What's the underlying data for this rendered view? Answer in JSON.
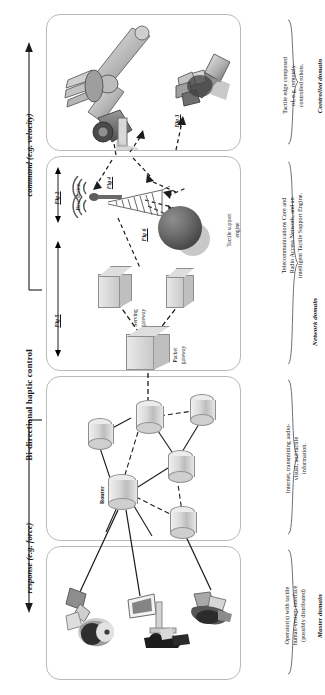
{
  "figure": {
    "orientation": "rotated-90-ccw"
  },
  "axis": {
    "main_label": "Bi-directional haptic control",
    "command_label": "command (e.g. velocity)",
    "response_label": "response (e.g. force)"
  },
  "fig_refs": {
    "fig2": "Fig 2",
    "fig3": "Fig 3",
    "fig4": "Fig 4",
    "fig5": "Fig 5",
    "fig6": "Fig 6"
  },
  "domains": [
    {
      "id": "controlled",
      "name": "Controlled domain",
      "description": "Tactile edge composed of, e.g. remotely controlled robots.",
      "nodes": [
        {
          "name": "robot-arm",
          "label": ""
        },
        {
          "name": "robot-gripper-hand",
          "label": ""
        }
      ]
    },
    {
      "id": "network",
      "name": "Network domain",
      "description": "Telecommunications Core and Radio Access Network, and an intelligent Tactile Support Engine.",
      "nodes": [
        {
          "name": "base-station",
          "label": "Base station"
        },
        {
          "name": "tactile-support-engine",
          "label": "Tactile support engine"
        },
        {
          "name": "serving-gateway",
          "label": "Serving gateway"
        },
        {
          "name": "packet-gateway",
          "label": "Packet gateway"
        }
      ]
    },
    {
      "id": "internet",
      "name": "",
      "description": "Internet, transmitting audio-visual, and tactile information.",
      "nodes": [
        {
          "name": "router",
          "label": "Router"
        }
      ]
    },
    {
      "id": "master",
      "name": "Master domain",
      "description": "Operator(s) with tactile human-system interface (possibly distributed)",
      "nodes": [
        {
          "name": "operator-one",
          "label": ""
        },
        {
          "name": "operator-two",
          "label": ""
        },
        {
          "name": "operator-three",
          "label": ""
        }
      ]
    }
  ],
  "labels": {
    "base_station": "Base station",
    "tactile_support_engine_l1": "Tactile support",
    "tactile_support_engine_l2": "engine",
    "serving_gateway_l1": "Serving",
    "serving_gateway_l2": "gateway",
    "packet_gateway_l1": "Packet",
    "packet_gateway_l2": "gateway",
    "router": "Router"
  },
  "descriptions": {
    "controlled_l1": "Tactile edge composed",
    "controlled_l2": "of, e.g. remotely",
    "controlled_l3": "controlled robots.",
    "network_l1": "Telecommunications Core and",
    "network_l2": "Radio Access Network, and an",
    "network_l3": "intelligent Tactile Support Engine.",
    "internet_l1": "Internet, transmitting audio-",
    "internet_l2": "visual, and tactile",
    "internet_l3": "information.",
    "master_l1": "Operator(s) with tactile",
    "master_l2": "human-system interface",
    "master_l3": "(possibly distributed)"
  },
  "domain_names": {
    "controlled": "Controlled domain",
    "network": "Network domain",
    "master": "Master domain"
  },
  "colors": {
    "panel_border": "#b9b9b9",
    "node_fill": "#d6d6d6",
    "node_stroke": "#8d8d8d",
    "line": "#2b2b2b",
    "text": "#1a1a1a"
  }
}
